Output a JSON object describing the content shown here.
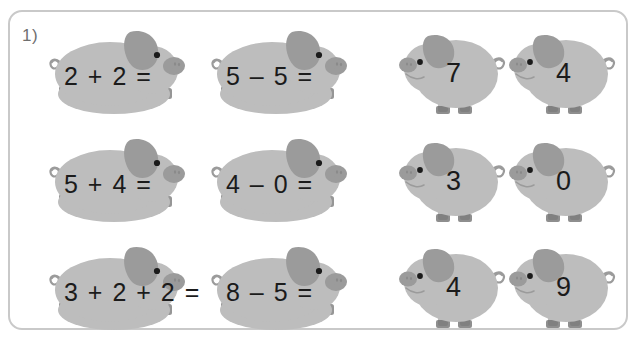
{
  "worksheet": {
    "exercise_number": "1)",
    "frame_color": "#c9c9c9",
    "background_color": "#ffffff",
    "text_color": "#1b1b1b",
    "pig_body_color": "#bdbdbd",
    "pig_shade_color": "#9b9b9b",
    "pig_dark_color": "#6e6e6e"
  },
  "equations": {
    "icon": "lying-pig-icon",
    "items": [
      {
        "id": "eq-1",
        "text": "2 + 2 =",
        "row": 1,
        "col": 1
      },
      {
        "id": "eq-2",
        "text": "5 – 5 =",
        "row": 1,
        "col": 2
      },
      {
        "id": "eq-3",
        "text": "5 + 4 =",
        "row": 2,
        "col": 1
      },
      {
        "id": "eq-4",
        "text": "4 – 0 =",
        "row": 2,
        "col": 2
      },
      {
        "id": "eq-5",
        "text": "3 + 2 + 2 =",
        "row": 3,
        "col": 1
      },
      {
        "id": "eq-6",
        "text": "8 – 5 =",
        "row": 3,
        "col": 2
      }
    ]
  },
  "answers": {
    "icon": "standing-pig-icon",
    "items": [
      {
        "id": "ans-1",
        "text": "7",
        "row": 1,
        "col": 1
      },
      {
        "id": "ans-2",
        "text": "4",
        "row": 1,
        "col": 2
      },
      {
        "id": "ans-3",
        "text": "3",
        "row": 2,
        "col": 1
      },
      {
        "id": "ans-4",
        "text": "0",
        "row": 2,
        "col": 2
      },
      {
        "id": "ans-5",
        "text": "4",
        "row": 3,
        "col": 1
      },
      {
        "id": "ans-6",
        "text": "9",
        "row": 3,
        "col": 2
      }
    ]
  }
}
